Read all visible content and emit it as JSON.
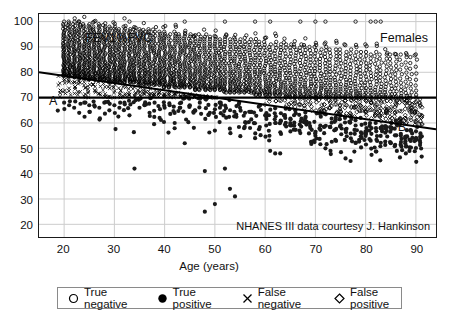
{
  "chart_data": {
    "type": "scatter",
    "title": "",
    "group_label": "Females",
    "ylabel": "FEV1%FVC",
    "xlabel": "Age (years)",
    "xlim": [
      15,
      94
    ],
    "ylim": [
      15,
      103
    ],
    "xticks": [
      20,
      30,
      40,
      50,
      60,
      70,
      80,
      90
    ],
    "yticks": [
      20,
      30,
      40,
      50,
      60,
      70,
      80,
      90,
      100
    ],
    "grid": true,
    "legend_position": "below-axes",
    "source_note": "NHANES III data courtesy J. Hankinson",
    "annotations": [
      {
        "name": "A",
        "text": "A",
        "meaning": "lower limit of normal (LLN) regression line",
        "x": 18.5,
        "y": 74.5
      },
      {
        "name": "B",
        "text": "B",
        "meaning": "fixed FEV1/FVC = 70% cutoff line",
        "x": 88.0,
        "y": 66.0
      }
    ],
    "reference_lines": [
      {
        "name": "line-a-lln",
        "label": "A",
        "type": "linear",
        "x_start": 15,
        "y_start": 80.0,
        "x_end": 94,
        "y_end": 57.5,
        "style": "solid",
        "width": 2,
        "color": "#000000"
      },
      {
        "name": "line-b-fixed-70",
        "label": "B",
        "type": "horizontal",
        "y": 70,
        "x_start": 15,
        "x_end": 94,
        "style": "solid",
        "width": 2.5,
        "color": "#000000"
      }
    ],
    "legend": [
      {
        "key": "true-negative",
        "label": "True negative",
        "marker": "open-circle"
      },
      {
        "key": "true-positive",
        "label": "True positive",
        "marker": "filled-circle"
      },
      {
        "key": "false-negative",
        "label": "False negative",
        "marker": "cross-x"
      },
      {
        "key": "false-positive",
        "label": "False positive",
        "marker": "open-diamond"
      }
    ],
    "series": [
      {
        "name": "True negative",
        "marker": "open-circle",
        "description": "FEV1%FVC above both the LLN line A and the 70% line B",
        "color": "#000000",
        "n_points": 1760,
        "density_by_age": [
          {
            "age": 20,
            "y_min": 78,
            "y_max": 99,
            "count": 46
          },
          {
            "age": 21,
            "y_min": 78,
            "y_max": 100,
            "count": 44
          },
          {
            "age": 22,
            "y_min": 78,
            "y_max": 99,
            "count": 45
          },
          {
            "age": 23,
            "y_min": 77,
            "y_max": 100,
            "count": 44
          },
          {
            "age": 24,
            "y_min": 77,
            "y_max": 99,
            "count": 43
          },
          {
            "age": 25,
            "y_min": 77,
            "y_max": 99,
            "count": 42
          },
          {
            "age": 26,
            "y_min": 77,
            "y_max": 98,
            "count": 41
          },
          {
            "age": 27,
            "y_min": 77,
            "y_max": 99,
            "count": 42
          },
          {
            "age": 28,
            "y_min": 77,
            "y_max": 98,
            "count": 41
          },
          {
            "age": 29,
            "y_min": 76,
            "y_max": 98,
            "count": 40
          },
          {
            "age": 30,
            "y_min": 76,
            "y_max": 98,
            "count": 40
          },
          {
            "age": 31,
            "y_min": 76,
            "y_max": 97,
            "count": 39
          },
          {
            "age": 32,
            "y_min": 76,
            "y_max": 98,
            "count": 39
          },
          {
            "age": 33,
            "y_min": 76,
            "y_max": 97,
            "count": 38
          },
          {
            "age": 34,
            "y_min": 76,
            "y_max": 97,
            "count": 38
          },
          {
            "age": 35,
            "y_min": 75,
            "y_max": 97,
            "count": 38
          },
          {
            "age": 36,
            "y_min": 75,
            "y_max": 96,
            "count": 37
          },
          {
            "age": 37,
            "y_min": 75,
            "y_max": 97,
            "count": 37
          },
          {
            "age": 38,
            "y_min": 75,
            "y_max": 96,
            "count": 36
          },
          {
            "age": 39,
            "y_min": 75,
            "y_max": 96,
            "count": 36
          },
          {
            "age": 40,
            "y_min": 74,
            "y_max": 96,
            "count": 36
          },
          {
            "age": 41,
            "y_min": 74,
            "y_max": 95,
            "count": 35
          },
          {
            "age": 42,
            "y_min": 74,
            "y_max": 96,
            "count": 35
          },
          {
            "age": 43,
            "y_min": 74,
            "y_max": 95,
            "count": 34
          },
          {
            "age": 44,
            "y_min": 74,
            "y_max": 95,
            "count": 34
          },
          {
            "age": 45,
            "y_min": 74,
            "y_max": 95,
            "count": 33
          },
          {
            "age": 46,
            "y_min": 73,
            "y_max": 94,
            "count": 33
          },
          {
            "age": 47,
            "y_min": 73,
            "y_max": 95,
            "count": 32
          },
          {
            "age": 48,
            "y_min": 73,
            "y_max": 94,
            "count": 32
          },
          {
            "age": 49,
            "y_min": 73,
            "y_max": 94,
            "count": 31
          },
          {
            "age": 50,
            "y_min": 73,
            "y_max": 94,
            "count": 31
          },
          {
            "age": 51,
            "y_min": 73,
            "y_max": 93,
            "count": 30
          },
          {
            "age": 52,
            "y_min": 72,
            "y_max": 94,
            "count": 30
          },
          {
            "age": 53,
            "y_min": 72,
            "y_max": 93,
            "count": 29
          },
          {
            "age": 54,
            "y_min": 72,
            "y_max": 93,
            "count": 29
          },
          {
            "age": 55,
            "y_min": 72,
            "y_max": 93,
            "count": 28
          },
          {
            "age": 56,
            "y_min": 72,
            "y_max": 92,
            "count": 28
          },
          {
            "age": 57,
            "y_min": 72,
            "y_max": 93,
            "count": 27
          },
          {
            "age": 58,
            "y_min": 71,
            "y_max": 92,
            "count": 27
          },
          {
            "age": 59,
            "y_min": 71,
            "y_max": 92,
            "count": 27
          },
          {
            "age": 60,
            "y_min": 71,
            "y_max": 92,
            "count": 26
          },
          {
            "age": 61,
            "y_min": 71,
            "y_max": 91,
            "count": 26
          },
          {
            "age": 62,
            "y_min": 71,
            "y_max": 92,
            "count": 25
          },
          {
            "age": 63,
            "y_min": 71,
            "y_max": 91,
            "count": 25
          },
          {
            "age": 64,
            "y_min": 70,
            "y_max": 91,
            "count": 24
          },
          {
            "age": 65,
            "y_min": 70,
            "y_max": 91,
            "count": 24
          },
          {
            "age": 66,
            "y_min": 70,
            "y_max": 90,
            "count": 24
          },
          {
            "age": 67,
            "y_min": 70,
            "y_max": 91,
            "count": 23
          },
          {
            "age": 68,
            "y_min": 70,
            "y_max": 90,
            "count": 23
          },
          {
            "age": 69,
            "y_min": 70,
            "y_max": 90,
            "count": 22
          },
          {
            "age": 70,
            "y_min": 70,
            "y_max": 90,
            "count": 22
          },
          {
            "age": 71,
            "y_min": 70,
            "y_max": 89,
            "count": 21
          },
          {
            "age": 72,
            "y_min": 70,
            "y_max": 90,
            "count": 21
          },
          {
            "age": 73,
            "y_min": 70,
            "y_max": 89,
            "count": 20
          },
          {
            "age": 74,
            "y_min": 70,
            "y_max": 89,
            "count": 20
          },
          {
            "age": 75,
            "y_min": 70,
            "y_max": 89,
            "count": 19
          },
          {
            "age": 76,
            "y_min": 70,
            "y_max": 88,
            "count": 19
          },
          {
            "age": 77,
            "y_min": 70,
            "y_max": 89,
            "count": 18
          },
          {
            "age": 78,
            "y_min": 70,
            "y_max": 88,
            "count": 18
          },
          {
            "age": 79,
            "y_min": 70,
            "y_max": 88,
            "count": 17
          },
          {
            "age": 80,
            "y_min": 70,
            "y_max": 88,
            "count": 17
          },
          {
            "age": 81,
            "y_min": 70,
            "y_max": 87,
            "count": 16
          },
          {
            "age": 82,
            "y_min": 70,
            "y_max": 88,
            "count": 16
          },
          {
            "age": 83,
            "y_min": 70,
            "y_max": 87,
            "count": 15
          },
          {
            "age": 84,
            "y_min": 70,
            "y_max": 87,
            "count": 15
          },
          {
            "age": 85,
            "y_min": 70,
            "y_max": 87,
            "count": 14
          },
          {
            "age": 86,
            "y_min": 70,
            "y_max": 86,
            "count": 13
          },
          {
            "age": 87,
            "y_min": 70,
            "y_max": 87,
            "count": 12
          },
          {
            "age": 88,
            "y_min": 70,
            "y_max": 86,
            "count": 11
          },
          {
            "age": 89,
            "y_min": 70,
            "y_max": 86,
            "count": 10
          },
          {
            "age": 90,
            "y_min": 70,
            "y_max": 85,
            "count": 8
          }
        ],
        "outliers": [
          {
            "age": 20,
            "y": 100
          },
          {
            "age": 23,
            "y": 100
          },
          {
            "age": 26,
            "y": 100
          },
          {
            "age": 33,
            "y": 100
          },
          {
            "age": 44,
            "y": 100
          },
          {
            "age": 52,
            "y": 100
          },
          {
            "age": 58,
            "y": 100
          },
          {
            "age": 61,
            "y": 100
          },
          {
            "age": 67,
            "y": 100
          },
          {
            "age": 70,
            "y": 100
          },
          {
            "age": 72,
            "y": 100
          },
          {
            "age": 78,
            "y": 100
          },
          {
            "age": 81,
            "y": 100
          },
          {
            "age": 82,
            "y": 100
          },
          {
            "age": 83,
            "y": 100
          }
        ]
      },
      {
        "name": "True positive",
        "marker": "filled-circle",
        "description": "FEV1%FVC below both the LLN line A and the 70% line B",
        "color": "#1a1a1a",
        "n_points": 300,
        "points": [
          {
            "age": 20,
            "y": 68
          },
          {
            "age": 21,
            "y": 67
          },
          {
            "age": 22,
            "y": 66
          },
          {
            "age": 23,
            "y": 64
          },
          {
            "age": 24,
            "y": 68
          },
          {
            "age": 25,
            "y": 67
          },
          {
            "age": 26,
            "y": 67
          },
          {
            "age": 27,
            "y": 66
          },
          {
            "age": 28,
            "y": 68
          },
          {
            "age": 29,
            "y": 65
          },
          {
            "age": 30,
            "y": 67
          },
          {
            "age": 31,
            "y": 66
          },
          {
            "age": 32,
            "y": 68
          },
          {
            "age": 33,
            "y": 63
          },
          {
            "age": 34,
            "y": 42
          },
          {
            "age": 35,
            "y": 66
          },
          {
            "age": 36,
            "y": 67
          },
          {
            "age": 37,
            "y": 64
          },
          {
            "age": 38,
            "y": 68
          },
          {
            "age": 39,
            "y": 62
          },
          {
            "age": 40,
            "y": 66
          },
          {
            "age": 41,
            "y": 67
          },
          {
            "age": 42,
            "y": 60
          },
          {
            "age": 43,
            "y": 66
          },
          {
            "age": 44,
            "y": 52
          },
          {
            "age": 45,
            "y": 67
          },
          {
            "age": 46,
            "y": 65
          },
          {
            "age": 47,
            "y": 68
          },
          {
            "age": 48,
            "y": 25
          },
          {
            "age": 48,
            "y": 41
          },
          {
            "age": 49,
            "y": 64
          },
          {
            "age": 50,
            "y": 28
          },
          {
            "age": 50,
            "y": 57
          },
          {
            "age": 51,
            "y": 66
          },
          {
            "age": 52,
            "y": 42
          },
          {
            "age": 53,
            "y": 34
          },
          {
            "age": 54,
            "y": 31
          },
          {
            "age": 55,
            "y": 66
          },
          {
            "age": 56,
            "y": 64
          },
          {
            "age": 57,
            "y": 58
          },
          {
            "age": 58,
            "y": 54
          },
          {
            "age": 59,
            "y": 67
          },
          {
            "age": 60,
            "y": 63
          },
          {
            "age": 61,
            "y": 49
          },
          {
            "age": 62,
            "y": 48
          },
          {
            "age": 63,
            "y": 48
          },
          {
            "age": 64,
            "y": 62
          },
          {
            "age": 65,
            "y": 60
          },
          {
            "age": 66,
            "y": 65
          },
          {
            "age": 67,
            "y": 56
          },
          {
            "age": 68,
            "y": 62
          },
          {
            "age": 69,
            "y": 58
          },
          {
            "age": 70,
            "y": 55
          },
          {
            "age": 71,
            "y": 64
          },
          {
            "age": 72,
            "y": 50
          },
          {
            "age": 73,
            "y": 49
          },
          {
            "age": 74,
            "y": 61
          },
          {
            "age": 75,
            "y": 63
          },
          {
            "age": 76,
            "y": 46
          },
          {
            "age": 77,
            "y": 45
          },
          {
            "age": 78,
            "y": 59
          },
          {
            "age": 79,
            "y": 62
          },
          {
            "age": 80,
            "y": 56
          },
          {
            "age": 81,
            "y": 53
          },
          {
            "age": 82,
            "y": 60
          },
          {
            "age": 83,
            "y": 58
          },
          {
            "age": 84,
            "y": 64
          },
          {
            "age": 85,
            "y": 52
          },
          {
            "age": 86,
            "y": 61
          },
          {
            "age": 87,
            "y": 55
          },
          {
            "age": 88,
            "y": 48
          },
          {
            "age": 89,
            "y": 57
          },
          {
            "age": 90,
            "y": 54
          }
        ]
      },
      {
        "name": "False negative",
        "marker": "cross-x",
        "description": "Below the LLN line A but above the 70% line B (ages under ~62)",
        "color": "#000000",
        "n_points": 180,
        "age_range": [
          19,
          62
        ],
        "band": "between line A and line B"
      },
      {
        "name": "False positive",
        "marker": "open-diamond",
        "description": "Above the LLN line A but below the 70% line B (ages over ~60)",
        "color": "#000000",
        "n_points": 150,
        "age_range": [
          60,
          91
        ],
        "band": "between line B and line A"
      }
    ]
  },
  "axes": {
    "x_tick_labels": [
      "20",
      "30",
      "40",
      "50",
      "60",
      "70",
      "80",
      "90"
    ],
    "y_tick_labels": [
      "100",
      "90",
      "80",
      "70",
      "60",
      "50",
      "40",
      "30",
      "20"
    ],
    "x_title": "Age (years)",
    "y_inplot_title": "FEV1%FVC"
  },
  "labels": {
    "group": "Females",
    "line_a": "A",
    "line_b": "B",
    "source": "NHANES III data courtesy J. Hankinson"
  },
  "legend": {
    "items": [
      {
        "label": "True negative",
        "marker": "open-circle"
      },
      {
        "label": "True positive",
        "marker": "filled-circle"
      },
      {
        "label": "False negative",
        "marker": "cross-x"
      },
      {
        "label": "False positive",
        "marker": "open-diamond"
      }
    ]
  },
  "colors": {
    "background": "#ffffff",
    "axis": "#1a1a1a",
    "grid": "#cccccc",
    "marker": "#000000",
    "legend_border": "#8a8a8a"
  }
}
